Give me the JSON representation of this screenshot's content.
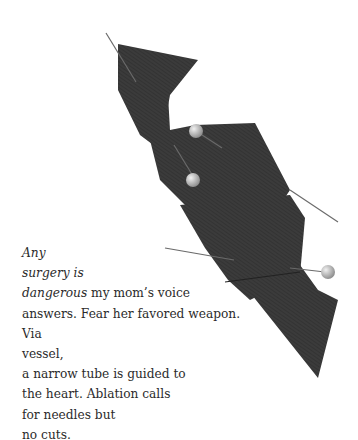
{
  "artwork": {
    "subject": "pinned dark grosgrain ribbon",
    "ribbon_color": "#3a3a3a",
    "pin_head_color": "#b8b8b8",
    "background": "#ffffff"
  },
  "poem": {
    "lines": [
      {
        "italic": "Any",
        "rest": ""
      },
      {
        "italic": "surgery is",
        "rest": ""
      },
      {
        "italic": "dangerous",
        "rest": " my mom’s voice"
      },
      {
        "italic": "",
        "rest": "answers. Fear her favored weapon."
      },
      {
        "italic": "",
        "rest": "Via"
      },
      {
        "italic": "",
        "rest": "vessel,"
      },
      {
        "italic": "",
        "rest": "a narrow tube is guided to"
      },
      {
        "italic": "",
        "rest": "the heart. Ablation calls"
      },
      {
        "italic": "",
        "rest": "for needles but"
      },
      {
        "italic": "",
        "rest": "no cuts."
      }
    ]
  }
}
